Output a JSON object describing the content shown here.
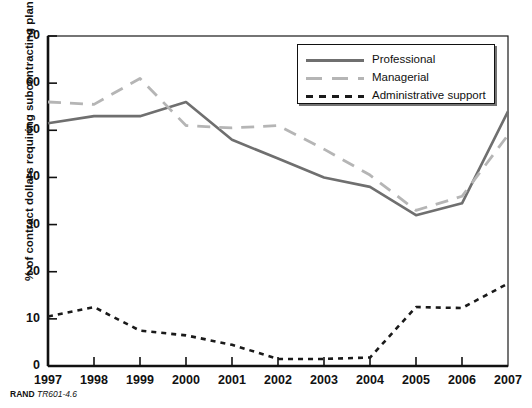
{
  "top_cut_text": "",
  "footer": {
    "source_bold": "RAND",
    "source_italic": "TR601-4.6"
  },
  "legend": {
    "items": [
      {
        "label": "Professional",
        "style": "solid",
        "color": "#6f6f6f"
      },
      {
        "label": "Managerial",
        "style": "dashed",
        "color": "#b5b5b5"
      },
      {
        "label": "Administrative support",
        "style": "dotted",
        "color": "#1a1a1a"
      }
    ]
  },
  "chart_data": {
    "type": "line",
    "title": "",
    "xlabel": "",
    "ylabel": "% of contract dollars requiring subcontracting plan",
    "x": [
      "1997",
      "1998",
      "1999",
      "2000",
      "2001",
      "2002",
      "2003",
      "2004",
      "2005",
      "2006",
      "2007"
    ],
    "xtick_labels": [
      "1997",
      "1998",
      "1999",
      "2000",
      "2001",
      "2002",
      "2003",
      "2004",
      "2005",
      "2006",
      "2007"
    ],
    "ytick_labels": [
      "0",
      "10",
      "20",
      "30",
      "40",
      "50",
      "60",
      "70"
    ],
    "yticks": [
      0,
      10,
      20,
      30,
      40,
      50,
      60,
      70
    ],
    "ylim": [
      0,
      70
    ],
    "grid": false,
    "legend_position": "top-right",
    "series": [
      {
        "name": "Professional",
        "style": "solid",
        "color": "#6f6f6f",
        "values": [
          51.5,
          53,
          53,
          56,
          48,
          44,
          40,
          38,
          32,
          34.5,
          54
        ]
      },
      {
        "name": "Managerial",
        "style": "dashed",
        "color": "#b5b5b5",
        "values": [
          56,
          55.5,
          61,
          51,
          50.5,
          51,
          46,
          40.5,
          33,
          36,
          49
        ]
      },
      {
        "name": "Administrative support",
        "style": "dotted",
        "color": "#1a1a1a",
        "values": [
          10.5,
          12.5,
          7.5,
          6.5,
          4.5,
          1.5,
          1.5,
          1.8,
          12.5,
          12.3,
          17.5
        ]
      }
    ]
  }
}
